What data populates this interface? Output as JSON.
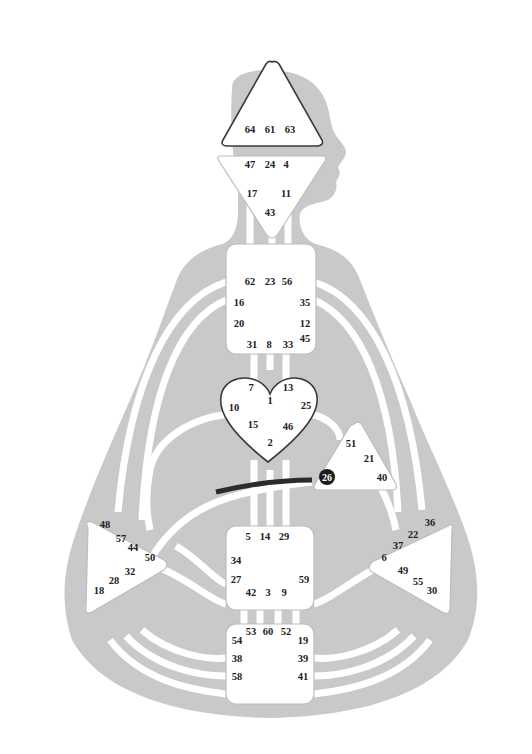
{
  "diagram": {
    "type": "Human Design bodygraph",
    "colors": {
      "body": "#c9c9c9",
      "channel": "#ffffff",
      "center_fill": "#ffffff",
      "center_outline": "#b5b5b5",
      "defined_outline": "#3a3a3a",
      "active_gate_fill": "#1c1c1c",
      "active_channel": "#2b2b2b"
    },
    "centers": {
      "head": {
        "name": "Head",
        "gates": [
          "64",
          "61",
          "63"
        ]
      },
      "ajna": {
        "name": "Ajna",
        "gates": [
          "47",
          "24",
          "4",
          "17",
          "11",
          "43"
        ]
      },
      "throat": {
        "name": "Throat",
        "gates": [
          "62",
          "23",
          "56",
          "16",
          "35",
          "20",
          "12",
          "45",
          "31",
          "8",
          "33"
        ]
      },
      "g": {
        "name": "G Center",
        "gates": [
          "7",
          "1",
          "13",
          "10",
          "25",
          "15",
          "46",
          "2"
        ]
      },
      "ego": {
        "name": "Heart / Ego",
        "gates": [
          "51",
          "21",
          "26",
          "40"
        ]
      },
      "spleen": {
        "name": "Spleen",
        "gates": [
          "48",
          "57",
          "44",
          "50",
          "32",
          "28",
          "18"
        ]
      },
      "sacral": {
        "name": "Sacral",
        "gates": [
          "5",
          "14",
          "29",
          "34",
          "27",
          "59",
          "42",
          "3",
          "9"
        ]
      },
      "solar_plexus": {
        "name": "Solar Plexus",
        "gates": [
          "36",
          "22",
          "37",
          "6",
          "49",
          "55",
          "30"
        ]
      },
      "root": {
        "name": "Root",
        "gates": [
          "53",
          "60",
          "52",
          "54",
          "19",
          "38",
          "39",
          "58",
          "41"
        ]
      }
    },
    "active_gates": [
      "26"
    ],
    "highlighted_channel": {
      "from": "26",
      "to": "44",
      "partial": true
    }
  }
}
